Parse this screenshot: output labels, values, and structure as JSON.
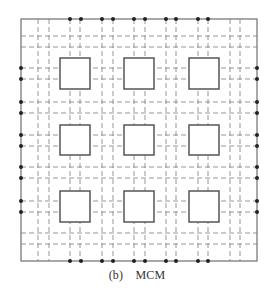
{
  "caption": {
    "label": "(b)",
    "title": "MCM"
  },
  "colors": {
    "border": "#7a7a7a",
    "grid": "#8a8a8a",
    "chip": "#555555",
    "pin": "#222222"
  },
  "frame": {
    "x1": 21,
    "y1": 19,
    "x2": 257,
    "y2": 261
  },
  "grid": {
    "vertical_x": [
      38,
      49,
      70,
      80,
      102,
      113,
      134,
      145,
      166,
      176,
      198,
      208,
      230,
      240
    ],
    "horizontal_y": [
      36,
      47,
      68,
      79,
      102,
      113,
      135,
      146,
      167,
      178,
      201,
      212,
      233,
      244
    ],
    "dash": "5 3"
  },
  "chips": {
    "columns_x": [
      [
        60,
        90
      ],
      [
        124,
        154
      ],
      [
        189,
        219
      ]
    ],
    "rows_y": [
      [
        58,
        89
      ],
      [
        125,
        155
      ],
      [
        191,
        222
      ]
    ]
  },
  "pins": {
    "top_bottom_x": [
      70,
      81,
      102,
      113,
      134,
      145,
      166,
      176,
      198,
      208
    ],
    "left_right_y": [
      68,
      79,
      102,
      113,
      135,
      146,
      167,
      178,
      201,
      212
    ]
  }
}
